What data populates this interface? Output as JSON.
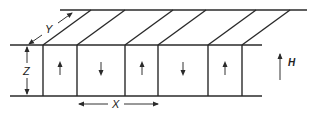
{
  "diagram": {
    "labels": {
      "depth": "Y",
      "thickness": "Z",
      "period": "X",
      "field": "H"
    },
    "domains": [
      {
        "direction": "up"
      },
      {
        "direction": "down"
      },
      {
        "direction": "up"
      },
      {
        "direction": "down"
      },
      {
        "direction": "up"
      }
    ],
    "colors": {
      "line": "#2a2a2a",
      "background": "#ffffff"
    }
  }
}
